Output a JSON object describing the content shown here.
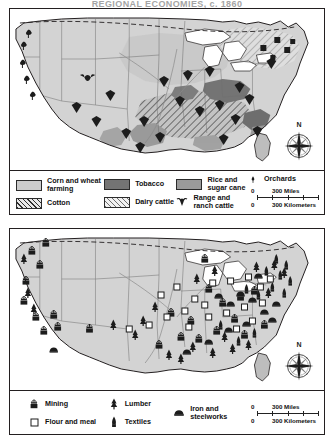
{
  "page": {
    "clipped_title": "REGIONAL ECONOMIES, c. 1860"
  },
  "maps": [
    {
      "id": "agriculture",
      "name": "agriculture-map",
      "legend": {
        "columns": [
          {
            "items": [
              {
                "label": "Corn and wheat farming",
                "symbol": "swatch-corn"
              },
              {
                "label": "Cotton",
                "symbol": "swatch-cotton"
              }
            ]
          },
          {
            "items": [
              {
                "label": "Tobacco",
                "symbol": "swatch-tobacco"
              },
              {
                "label": "Dairy cattle",
                "symbol": "swatch-dairy"
              }
            ]
          },
          {
            "items": [
              {
                "label": "Rice and sugar cane",
                "symbol": "swatch-rice"
              },
              {
                "label": "Range and ranch cattle",
                "symbol": "cattle-icon"
              }
            ]
          },
          {
            "items": [
              {
                "label": "Orchards",
                "symbol": "orchard-icon"
              }
            ]
          }
        ],
        "scale": {
          "miles": {
            "start": "0",
            "end": "300 Miles"
          },
          "kilometers": {
            "start": "0",
            "end": "300 Kilometers"
          }
        }
      },
      "compass": {
        "label": "N"
      }
    },
    {
      "id": "industry",
      "name": "industry-map",
      "legend": {
        "columns": [
          {
            "items": [
              {
                "label": "Mining",
                "symbol": "mining-icon"
              },
              {
                "label": "Flour and meal",
                "symbol": "flour-icon"
              }
            ]
          },
          {
            "items": [
              {
                "label": "Lumber",
                "symbol": "lumber-icon"
              },
              {
                "label": "Textiles",
                "symbol": "textiles-icon"
              }
            ]
          },
          {
            "items": [
              {
                "label": "Iron and steelworks",
                "symbol": "ironworks-icon"
              }
            ]
          }
        ],
        "scale": {
          "miles": {
            "start": "0",
            "end": "300 Miles"
          },
          "kilometers": {
            "start": "0",
            "end": "300 Kilometers"
          }
        }
      },
      "compass": {
        "label": "N"
      }
    }
  ],
  "colors": {
    "land": "#d3d3d3",
    "corn_wheat": "#cbcbcb",
    "tobacco": "#747474",
    "rice_sugar": "#9a9a9a",
    "water": "#ffffff",
    "outline": "#231f20"
  }
}
